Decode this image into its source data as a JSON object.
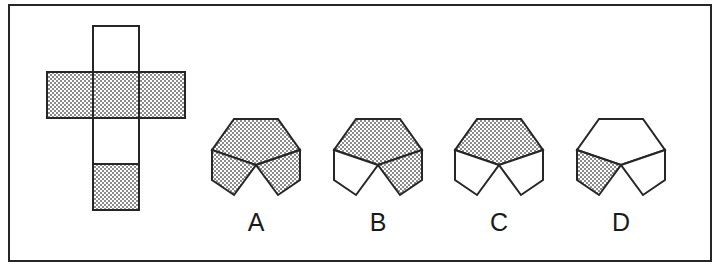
{
  "figure": {
    "kind": "spatial-reasoning-cube-net-question",
    "background_color": "#ffffff",
    "line_color": "#262626",
    "shaded_fill_description": "50% dithered halftone gray",
    "shaded_fill_color": "#a8a8a8",
    "unshaded_fill_color": "#ffffff",
    "frame": {
      "x": 8,
      "y": 4,
      "width": 704,
      "height": 258,
      "border_width": 2
    }
  },
  "net": {
    "name": "cube-net-cross",
    "cell_size": 46,
    "origin_x": 47,
    "origin_y": 26,
    "description": "Cross-shaped net of a cube: a vertical column of four squares with a horizontal row of three squares crossing at the second square from the top.",
    "cells": [
      {
        "id": "net-cell-top",
        "col": 1,
        "row": 0,
        "shaded": false
      },
      {
        "id": "net-cell-left",
        "col": 0,
        "row": 1,
        "shaded": true
      },
      {
        "id": "net-cell-center",
        "col": 1,
        "row": 1,
        "shaded": true
      },
      {
        "id": "net-cell-right",
        "col": 2,
        "row": 1,
        "shaded": true
      },
      {
        "id": "net-cell-lower-middle",
        "col": 1,
        "row": 2,
        "shaded": false
      },
      {
        "id": "net-cell-bottom",
        "col": 1,
        "row": 3,
        "shaded": true
      }
    ]
  },
  "options": [
    {
      "id": "option-a",
      "label": "A",
      "center_x": 256,
      "center_y": 163,
      "label_x": 256,
      "label_y": 222,
      "faces": {
        "top": true,
        "left": true,
        "right": true
      }
    },
    {
      "id": "option-b",
      "label": "B",
      "center_x": 378,
      "center_y": 163,
      "label_x": 378,
      "label_y": 222,
      "faces": {
        "top": true,
        "left": false,
        "right": true
      }
    },
    {
      "id": "option-c",
      "label": "C",
      "center_x": 499,
      "center_y": 163,
      "label_x": 499,
      "label_y": 222,
      "faces": {
        "top": true,
        "left": false,
        "right": false
      }
    },
    {
      "id": "option-d",
      "label": "D",
      "center_x": 621,
      "center_y": 163,
      "label_x": 621,
      "label_y": 222,
      "faces": {
        "top": false,
        "left": true,
        "right": false
      }
    }
  ],
  "cube_geometry": {
    "half_width": 44,
    "half_height": 31,
    "side_height": 30
  }
}
